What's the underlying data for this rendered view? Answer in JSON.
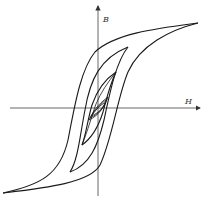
{
  "diagram": {
    "type": "hysteresis-loops",
    "axes": {
      "vertical_label": "B",
      "horizontal_label": "H"
    },
    "colors": {
      "line": "#1a1a1a",
      "axis": "#555555",
      "background": "#ffffff"
    },
    "loops": [
      {
        "name": "major-loop",
        "tip_top": [
          198,
          23
        ],
        "tip_bottom": [
          3,
          193
        ],
        "h_crossings": [
          77,
          120
        ]
      },
      {
        "name": "loop-2",
        "tip_top": [
          128,
          47
        ],
        "tip_bottom": [
          70,
          172
        ],
        "h_crossings": [
          84,
          110
        ]
      },
      {
        "name": "loop-3",
        "tip_top": [
          116,
          72
        ],
        "tip_bottom": [
          82,
          145
        ]
      },
      {
        "name": "loop-4",
        "tip_top": [
          108,
          97
        ],
        "tip_bottom": [
          89,
          120
        ]
      },
      {
        "name": "loop-5",
        "tip_top": [
          106,
          102
        ],
        "tip_bottom": [
          91,
          116
        ]
      }
    ]
  }
}
